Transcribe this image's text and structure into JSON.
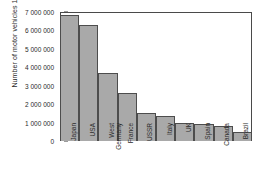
{
  "chart_data": {
    "type": "bar",
    "title": "",
    "subtitle": "",
    "xlabel": "",
    "ylabel": "Number of motor vehicles 1981",
    "categories": [
      "Japan",
      "USA",
      "West Germany",
      "France",
      "USSR",
      "Italy",
      "UK",
      "Spain",
      "Canada",
      "Brazil"
    ],
    "values": [
      6850000,
      6300000,
      3700000,
      2600000,
      1500000,
      1350000,
      1000000,
      900000,
      800000,
      500000
    ],
    "ylim": [
      0,
      7000000
    ],
    "ytick_values": [
      0,
      1000000,
      2000000,
      3000000,
      4000000,
      5000000,
      6000000,
      7000000
    ],
    "ytick_labels": [
      "0",
      "1 000 000",
      "2 000 000",
      "3 000 000",
      "4 000 000",
      "5 000 000",
      "6 000 000",
      "7 000 000"
    ],
    "grid": false,
    "legend": null,
    "legend_position": "none",
    "bar_fill_color": "#a9a9a9",
    "bar_edge_color": "#4d4d4d",
    "frame_color": "#4a4a4a",
    "background_color": "#ffffff"
  }
}
